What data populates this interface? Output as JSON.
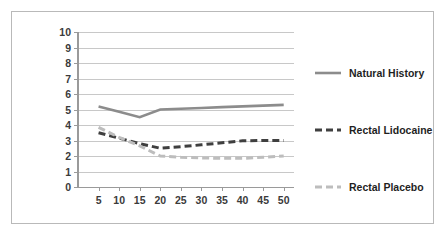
{
  "chart_data": {
    "type": "line",
    "title": "",
    "xlabel": "",
    "ylabel": "",
    "x": [
      5,
      10,
      15,
      20,
      25,
      30,
      35,
      40,
      45,
      50
    ],
    "categories": [
      "5",
      "10",
      "15",
      "20",
      "25",
      "30",
      "35",
      "40",
      "45",
      "50"
    ],
    "xlim": [
      0,
      52.5
    ],
    "ylim": [
      0,
      10
    ],
    "yticks": [
      0,
      1,
      2,
      3,
      4,
      5,
      6,
      7,
      8,
      9,
      10
    ],
    "ytick_labels": [
      "0",
      "1",
      "2",
      "3",
      "4",
      "5",
      "6",
      "7",
      "8",
      "9",
      "10"
    ],
    "grid": "horizontal",
    "legend_position": "right",
    "series": [
      {
        "name": "Natural History",
        "style": "solid",
        "color": "#8c8c8c",
        "values": [
          5.2,
          4.85,
          4.5,
          5.0,
          5.05,
          5.1,
          5.15,
          5.2,
          5.25,
          5.3
        ]
      },
      {
        "name": "Rectal Lidocaine",
        "style": "dashed",
        "color": "#3f3f3f",
        "values": [
          3.5,
          3.15,
          2.8,
          2.5,
          2.6,
          2.72,
          2.85,
          2.98,
          3.0,
          3.0
        ]
      },
      {
        "name": "Rectal Placebo",
        "style": "dashed",
        "color": "#bdbdbd",
        "values": [
          3.85,
          3.2,
          2.65,
          2.0,
          1.92,
          1.88,
          1.85,
          1.85,
          1.92,
          2.0
        ]
      }
    ]
  },
  "legend": {
    "items": [
      {
        "label": "Natural History"
      },
      {
        "label": "Rectal Lidocaine"
      },
      {
        "label": "Rectal Placebo"
      }
    ]
  }
}
